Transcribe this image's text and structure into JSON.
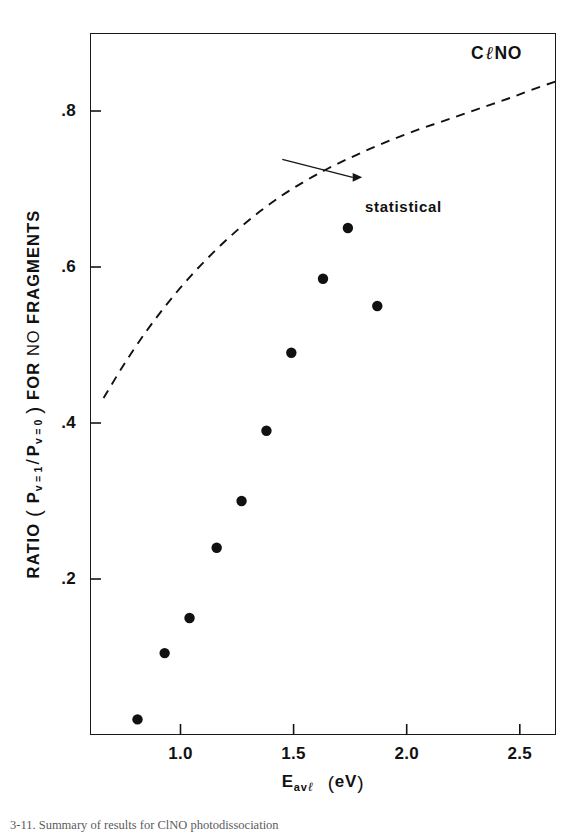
{
  "figure": {
    "corner_label_prefix": "C",
    "corner_label_ell": "ℓ",
    "corner_label_suffix": "NO",
    "caption": "3-11. Summary of results for ClNO photodissociation"
  },
  "annotation": {
    "label": "statistical"
  },
  "axes": {
    "y_title_parts": {
      "ratio": "RATIO",
      "open_paren": "(",
      "p1": "P",
      "p1_sub": "v = 1",
      "slash": "/",
      "p0": "P",
      "p0_sub": "v = 0",
      "close_paren": ")",
      "for": "FOR",
      "no": "NO",
      "fragments": "FRAGMENTS"
    },
    "x_title_parts": {
      "e": "E",
      "e_sub": "av",
      "e_sub_ell": "ℓ",
      "open_paren": "(",
      "unit": "eV",
      "close_paren": ")"
    },
    "x_ticks": [
      "1.0",
      "1.5",
      "2.0",
      "2.5"
    ],
    "y_ticks": [
      ".2",
      ".4",
      ".6",
      ".8"
    ]
  },
  "chart_data": {
    "type": "scatter",
    "title": "",
    "subtitle": "",
    "xlabel": "E_avℓ (eV)",
    "ylabel": "RATIO ( P_v=1 / P_v=0 ) FOR NO FRAGMENTS",
    "xlim": [
      0.6,
      2.66
    ],
    "ylim": [
      0.0,
      0.9
    ],
    "xticks": [
      1.0,
      1.5,
      2.0,
      2.5
    ],
    "yticks": [
      0.2,
      0.4,
      0.6,
      0.8
    ],
    "grid": false,
    "legend": false,
    "annotations": [
      {
        "text": "statistical",
        "x": 1.81,
        "y": 0.715,
        "arrow_to_x": 1.45,
        "arrow_to_y": 0.738
      }
    ],
    "series": [
      {
        "name": "measured",
        "type": "scatter",
        "marker": "filled-circle",
        "color": "#111111",
        "x": [
          0.81,
          0.93,
          1.04,
          1.16,
          1.27,
          1.38,
          1.49,
          1.63,
          1.74,
          1.87
        ],
        "y": [
          0.02,
          0.105,
          0.15,
          0.24,
          0.3,
          0.39,
          0.49,
          0.585,
          0.65,
          0.55
        ]
      },
      {
        "name": "statistical",
        "type": "line",
        "style": "dashed",
        "color": "#111111",
        "x": [
          0.66,
          0.75,
          0.85,
          0.95,
          1.05,
          1.15,
          1.25,
          1.35,
          1.45,
          1.55,
          1.65,
          1.75,
          1.85,
          1.95,
          2.05,
          2.15,
          2.25,
          2.35,
          2.45,
          2.55,
          2.66
        ],
        "y": [
          0.432,
          0.475,
          0.518,
          0.556,
          0.59,
          0.62,
          0.647,
          0.671,
          0.692,
          0.71,
          0.726,
          0.74,
          0.753,
          0.765,
          0.776,
          0.786,
          0.796,
          0.806,
          0.816,
          0.827,
          0.838
        ]
      }
    ]
  }
}
